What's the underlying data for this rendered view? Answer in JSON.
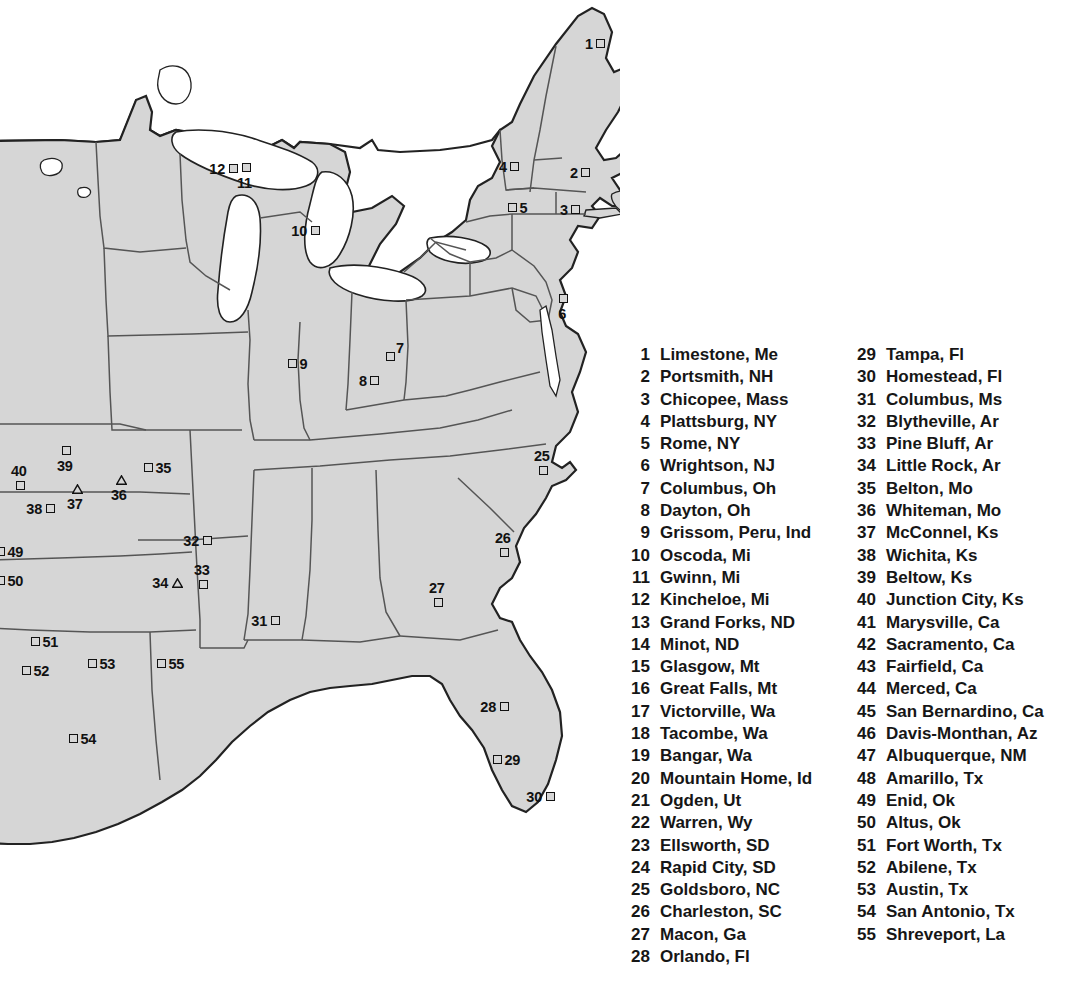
{
  "map": {
    "title": "",
    "colors": {
      "land_fill": "#d6d6d6",
      "water_fill": "#ffffff",
      "border_stroke": "#222222",
      "state_stroke": "#555555",
      "marker_stroke": "#111111",
      "text": "#161616"
    },
    "marker_shapes": {
      "square": "open-square",
      "triangle": "open-triangle"
    },
    "markers": [
      {
        "id": "1",
        "shape": "square",
        "label_side": "left",
        "x": 596,
        "y": 39
      },
      {
        "id": "2",
        "shape": "square",
        "label_side": "left",
        "x": 581,
        "y": 168
      },
      {
        "id": "3",
        "shape": "square",
        "label_side": "left",
        "x": 571,
        "y": 205
      },
      {
        "id": "4",
        "shape": "square",
        "label_side": "left",
        "x": 510,
        "y": 162
      },
      {
        "id": "5",
        "shape": "square",
        "label_side": "right",
        "x": 508,
        "y": 203
      },
      {
        "id": "6",
        "shape": "square",
        "label_side": "below",
        "x": 559,
        "y": 294
      },
      {
        "id": "7",
        "shape": "square",
        "label_side": "upright",
        "x": 386,
        "y": 352
      },
      {
        "id": "8",
        "shape": "square",
        "label_side": "left",
        "x": 370,
        "y": 376
      },
      {
        "id": "9",
        "shape": "square",
        "label_side": "right",
        "x": 288,
        "y": 359
      },
      {
        "id": "10",
        "shape": "square",
        "label_side": "left",
        "x": 311,
        "y": 226
      },
      {
        "id": "11",
        "shape": "square",
        "label_side": "below",
        "x": 242,
        "y": 163
      },
      {
        "id": "12",
        "shape": "square",
        "label_side": "left",
        "x": 229,
        "y": 164
      },
      {
        "id": "25",
        "shape": "square",
        "label_side": "above",
        "x": 539,
        "y": 466
      },
      {
        "id": "26",
        "shape": "square",
        "label_side": "above",
        "x": 500,
        "y": 548
      },
      {
        "id": "27",
        "shape": "square",
        "label_side": "above",
        "x": 434,
        "y": 598
      },
      {
        "id": "28",
        "shape": "square",
        "label_side": "left",
        "x": 500,
        "y": 702
      },
      {
        "id": "29",
        "shape": "square",
        "label_side": "right",
        "x": 493,
        "y": 755
      },
      {
        "id": "30",
        "shape": "square",
        "label_side": "left",
        "x": 546,
        "y": 792
      },
      {
        "id": "31",
        "shape": "square",
        "label_side": "left",
        "x": 271,
        "y": 616
      },
      {
        "id": "32",
        "shape": "square",
        "label_side": "left",
        "x": 203,
        "y": 536
      },
      {
        "id": "33",
        "shape": "square",
        "label_side": "above",
        "x": 199,
        "y": 580
      },
      {
        "id": "34",
        "shape": "triangle",
        "label_side": "left",
        "x": 172,
        "y": 578
      },
      {
        "id": "35",
        "shape": "square",
        "label_side": "right",
        "x": 144,
        "y": 463
      },
      {
        "id": "36",
        "shape": "triangle",
        "label_side": "below",
        "x": 116,
        "y": 475
      },
      {
        "id": "37",
        "shape": "triangle",
        "label_side": "below",
        "x": 72,
        "y": 484
      },
      {
        "id": "38",
        "shape": "square",
        "label_side": "left",
        "x": 46,
        "y": 504
      },
      {
        "id": "39",
        "shape": "square",
        "label_side": "below",
        "x": 62,
        "y": 446
      },
      {
        "id": "40",
        "shape": "square",
        "label_side": "above",
        "x": 16,
        "y": 481
      },
      {
        "id": "49",
        "shape": "square",
        "label_side": "right",
        "x": -4,
        "y": 547
      },
      {
        "id": "50",
        "shape": "square",
        "label_side": "right",
        "x": -4,
        "y": 576
      },
      {
        "id": "51",
        "shape": "square",
        "label_side": "right",
        "x": 31,
        "y": 637
      },
      {
        "id": "52",
        "shape": "square",
        "label_side": "right",
        "x": 22,
        "y": 666
      },
      {
        "id": "53",
        "shape": "square",
        "label_side": "right",
        "x": 88,
        "y": 659
      },
      {
        "id": "54",
        "shape": "square",
        "label_side": "right",
        "x": 69,
        "y": 734
      },
      {
        "id": "55",
        "shape": "square",
        "label_side": "right",
        "x": 157,
        "y": 659
      }
    ]
  },
  "legend": {
    "column_1": [
      {
        "num": "1",
        "label": "Limestone, Me"
      },
      {
        "num": "2",
        "label": "Portsmith, NH"
      },
      {
        "num": "3",
        "label": "Chicopee, Mass"
      },
      {
        "num": "4",
        "label": "Plattsburg, NY"
      },
      {
        "num": "5",
        "label": "Rome, NY"
      },
      {
        "num": "6",
        "label": "Wrightson, NJ"
      },
      {
        "num": "7",
        "label": "Columbus, Oh"
      },
      {
        "num": "8",
        "label": "Dayton, Oh"
      },
      {
        "num": "9",
        "label": "Grissom, Peru, Ind"
      },
      {
        "num": "10",
        "label": "Oscoda, Mi"
      },
      {
        "num": "11",
        "label": "Gwinn, Mi"
      },
      {
        "num": "12",
        "label": "Kincheloe, Mi"
      },
      {
        "num": "13",
        "label": "Grand Forks, ND"
      },
      {
        "num": "14",
        "label": "Minot, ND"
      },
      {
        "num": "15",
        "label": "Glasgow, Mt"
      },
      {
        "num": "16",
        "label": "Great Falls, Mt"
      },
      {
        "num": "17",
        "label": "Victorville, Wa"
      },
      {
        "num": "18",
        "label": "Tacombe, Wa"
      },
      {
        "num": "19",
        "label": "Bangar, Wa"
      },
      {
        "num": "20",
        "label": "Mountain Home, Id"
      },
      {
        "num": "21",
        "label": "Ogden, Ut"
      },
      {
        "num": "22",
        "label": "Warren, Wy"
      },
      {
        "num": "23",
        "label": "Ellsworth, SD"
      },
      {
        "num": "24",
        "label": "Rapid City, SD"
      },
      {
        "num": "25",
        "label": "Goldsboro, NC"
      },
      {
        "num": "26",
        "label": "Charleston, SC"
      },
      {
        "num": "27",
        "label": "Macon, Ga"
      },
      {
        "num": "28",
        "label": "Orlando, Fl"
      }
    ],
    "column_2": [
      {
        "num": "29",
        "label": "Tampa, Fl"
      },
      {
        "num": "30",
        "label": "Homestead, Fl"
      },
      {
        "num": "31",
        "label": "Columbus, Ms"
      },
      {
        "num": "32",
        "label": "Blytheville, Ar"
      },
      {
        "num": "33",
        "label": "Pine Bluff, Ar"
      },
      {
        "num": "34",
        "label": "Little Rock, Ar"
      },
      {
        "num": "35",
        "label": "Belton, Mo"
      },
      {
        "num": "36",
        "label": "Whiteman, Mo"
      },
      {
        "num": "37",
        "label": "McConnel, Ks"
      },
      {
        "num": "38",
        "label": "Wichita, Ks"
      },
      {
        "num": "39",
        "label": "Beltow, Ks"
      },
      {
        "num": "40",
        "label": "Junction City, Ks"
      },
      {
        "num": "41",
        "label": "Marysville, Ca"
      },
      {
        "num": "42",
        "label": "Sacramento, Ca"
      },
      {
        "num": "43",
        "label": "Fairfield, Ca"
      },
      {
        "num": "44",
        "label": "Merced, Ca"
      },
      {
        "num": "45",
        "label": "San Bernardino, Ca"
      },
      {
        "num": "46",
        "label": "Davis-Monthan, Az"
      },
      {
        "num": "47",
        "label": "Albuquerque, NM"
      },
      {
        "num": "48",
        "label": "Amarillo, Tx"
      },
      {
        "num": "49",
        "label": "Enid, Ok"
      },
      {
        "num": "50",
        "label": "Altus, Ok"
      },
      {
        "num": "51",
        "label": "Fort Worth, Tx"
      },
      {
        "num": "52",
        "label": "Abilene, Tx"
      },
      {
        "num": "53",
        "label": "Austin, Tx"
      },
      {
        "num": "54",
        "label": "San Antonio, Tx"
      },
      {
        "num": "55",
        "label": "Shreveport, La"
      }
    ]
  }
}
